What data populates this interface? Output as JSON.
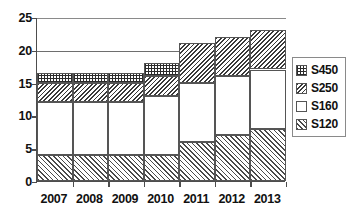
{
  "chart_data": {
    "type": "bar",
    "stacked": true,
    "title": "",
    "subtitle": "",
    "xlabel": "",
    "ylabel": "",
    "categories": [
      "2007",
      "2008",
      "2009",
      "2010",
      "2011",
      "2012",
      "2013"
    ],
    "series": [
      {
        "name": "S120",
        "values": [
          4,
          4,
          4,
          4,
          6,
          7,
          8
        ]
      },
      {
        "name": "S160",
        "values": [
          8,
          8,
          8,
          9,
          9,
          9,
          9
        ]
      },
      {
        "name": "S250",
        "values": [
          3,
          3,
          3,
          3,
          6,
          6,
          6
        ]
      },
      {
        "name": "S450",
        "values": [
          1.5,
          1.5,
          1.5,
          2,
          0,
          0,
          0
        ]
      }
    ],
    "series_order_bottom_to_top": [
      "S120",
      "S160",
      "S250",
      "S450"
    ],
    "cumulative_tops": {
      "2007": [
        4,
        12,
        15,
        16.5
      ],
      "2008": [
        4,
        12,
        15,
        16.5
      ],
      "2009": [
        4,
        12,
        15,
        16.5
      ],
      "2010": [
        4,
        13,
        16,
        18
      ],
      "2011": [
        6,
        15,
        21,
        21
      ],
      "2012": [
        7,
        16,
        22,
        22
      ],
      "2013": [
        8,
        17,
        23,
        23
      ]
    },
    "totals": [
      16.5,
      16.5,
      16.5,
      18,
      21,
      22,
      23
    ],
    "ylim": [
      0,
      25
    ],
    "ytick_values": [
      0,
      5,
      10,
      15,
      20,
      25
    ],
    "ytick_labels": [
      "0",
      "5",
      "10",
      "15",
      "20",
      "25"
    ],
    "grid": true,
    "grid_axis": "y",
    "legend_position": "right",
    "legend": [
      {
        "label": "S450",
        "pattern": "checkerboard"
      },
      {
        "label": "S250",
        "pattern": "dense-diagonal-hatch"
      },
      {
        "label": "S160",
        "pattern": "solid-white"
      },
      {
        "label": "S120",
        "pattern": "light-diagonal-hatch"
      }
    ],
    "colors": {
      "axis": "#4d4d4d",
      "gridline": "#6e6e6e",
      "text": "#111111",
      "background": "#ffffff",
      "pattern_ink": "#333333"
    }
  }
}
